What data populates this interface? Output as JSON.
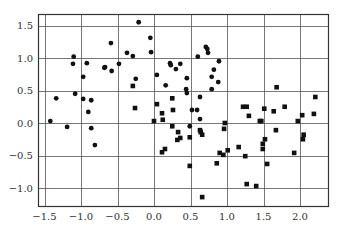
{
  "chart_data": {
    "type": "scatter",
    "title": "",
    "xlabel": "",
    "ylabel": "",
    "xlim": [
      -1.62,
      2.38
    ],
    "ylim": [
      -1.27,
      1.7
    ],
    "grid": true,
    "legend": null,
    "x_ticks": [
      -1.5,
      -1.0,
      -0.5,
      0.0,
      0.5,
      1.0,
      1.5,
      2.0
    ],
    "x_tick_labels": [
      "−1.5",
      "−1.0",
      "−0.5",
      "0.0",
      "0.5",
      "1.0",
      "1.5",
      "2.0"
    ],
    "y_ticks": [
      1.5,
      1.0,
      0.5,
      0.0,
      -0.5,
      -1.0
    ],
    "y_tick_labels": [
      "1.5",
      "1.0",
      "0.5",
      "0.0",
      "−0.5",
      "−1.0"
    ],
    "series": [
      {
        "name": "class 0",
        "marker": "circle",
        "color": "#111111",
        "points": [
          [
            -1.42,
            0.03
          ],
          [
            -1.19,
            -0.06
          ],
          [
            -1.34,
            0.38
          ],
          [
            -1.08,
            0.45
          ],
          [
            -0.97,
            0.37
          ],
          [
            -0.86,
            0.35
          ],
          [
            -0.9,
            0.17
          ],
          [
            -0.86,
            -0.08
          ],
          [
            -0.81,
            -0.34
          ],
          [
            -1.1,
            1.02
          ],
          [
            -1.11,
            0.91
          ],
          [
            -0.92,
            0.92
          ],
          [
            -0.97,
            0.71
          ],
          [
            -0.68,
            0.85
          ],
          [
            -0.67,
            0.86
          ],
          [
            -0.58,
            0.8
          ],
          [
            -0.48,
            0.91
          ],
          [
            -0.59,
            1.23
          ],
          [
            -0.37,
            1.08
          ],
          [
            -0.29,
            1.03
          ],
          [
            -0.21,
            1.55
          ],
          [
            -0.04,
            1.09
          ],
          [
            -0.05,
            1.31
          ],
          [
            -0.25,
            0.68
          ],
          [
            0.04,
            0.74
          ],
          [
            0.22,
            0.92
          ],
          [
            0.23,
            0.89
          ],
          [
            0.3,
            0.83
          ],
          [
            0.36,
            0.91
          ],
          [
            0.16,
            0.58
          ],
          [
            0.45,
            0.69
          ],
          [
            0.44,
            0.52
          ],
          [
            0.71,
            1.17
          ],
          [
            0.73,
            1.14
          ],
          [
            0.74,
            1.08
          ],
          [
            0.6,
            1.02
          ],
          [
            0.89,
            0.95
          ],
          [
            0.82,
            0.82
          ],
          [
            0.79,
            0.71
          ],
          [
            0.88,
            0.63
          ],
          [
            0.79,
            0.52
          ],
          [
            0.45,
            0.46
          ],
          [
            0.63,
            0.4
          ],
          [
            0.52,
            0.2
          ],
          [
            0.59,
            0.2
          ],
          [
            0.63,
            0.06
          ],
          [
            0.49,
            -0.05
          ]
        ]
      },
      {
        "name": "class 1",
        "marker": "square",
        "color": "#111111",
        "points": [
          [
            -0.29,
            0.57
          ],
          [
            -0.26,
            0.23
          ],
          [
            0.04,
            0.29
          ],
          [
            0.25,
            0.38
          ],
          [
            0.11,
            0.15
          ],
          [
            0.26,
            0.2
          ],
          [
            0.0,
            0.03
          ],
          [
            0.12,
            0.05
          ],
          [
            0.25,
            -0.05
          ],
          [
            0.33,
            -0.14
          ],
          [
            0.32,
            -0.26
          ],
          [
            0.36,
            -0.23
          ],
          [
            0.49,
            -0.22
          ],
          [
            0.63,
            -0.11
          ],
          [
            0.66,
            -0.18
          ],
          [
            0.15,
            -0.4
          ],
          [
            0.11,
            -0.45
          ],
          [
            0.49,
            -0.66
          ],
          [
            0.86,
            -0.62
          ],
          [
            0.9,
            -0.46
          ],
          [
            0.95,
            -0.49
          ],
          [
            1.01,
            -0.42
          ],
          [
            1.16,
            -0.37
          ],
          [
            1.25,
            -0.51
          ],
          [
            0.64,
            -0.14
          ],
          [
            0.66,
            -1.14
          ],
          [
            1.27,
            -0.94
          ],
          [
            1.4,
            -0.97
          ],
          [
            1.22,
            0.25
          ],
          [
            1.27,
            0.25
          ],
          [
            1.3,
            0.11
          ],
          [
            0.97,
            0.0
          ],
          [
            0.96,
            -0.09
          ],
          [
            1.45,
            0.03
          ],
          [
            1.51,
            0.22
          ],
          [
            1.64,
            0.18
          ],
          [
            1.79,
            0.25
          ],
          [
            1.68,
            0.55
          ],
          [
            2.21,
            0.4
          ],
          [
            2.19,
            0.14
          ],
          [
            2.03,
            0.12
          ],
          [
            1.97,
            0.03
          ],
          [
            1.67,
            -0.11
          ],
          [
            1.47,
            0.03
          ],
          [
            1.52,
            -0.25
          ],
          [
            1.49,
            -0.32
          ],
          [
            1.49,
            -0.4
          ],
          [
            2.05,
            -0.18
          ],
          [
            2.04,
            -0.25
          ],
          [
            1.92,
            -0.46
          ],
          [
            1.55,
            -0.63
          ]
        ]
      }
    ]
  },
  "style": {
    "frame_color": "#333333",
    "grid_color": "#555555",
    "marker_color": "#111111"
  }
}
